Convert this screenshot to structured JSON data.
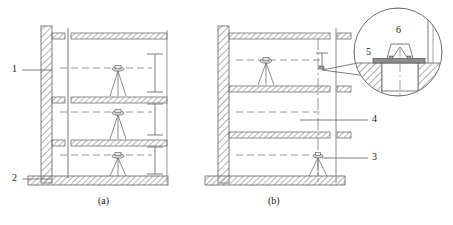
{
  "figure": {
    "captions": [
      {
        "id": "caption-a",
        "text": "(a)"
      },
      {
        "id": "caption-b",
        "text": "(b)"
      }
    ],
    "callouts": [
      {
        "id": "callout-1",
        "text": "1",
        "refers_to": "wall"
      },
      {
        "id": "callout-2",
        "text": "2",
        "refers_to": "foundation-slab"
      },
      {
        "id": "callout-3",
        "text": "3",
        "refers_to": "instrument-tripod"
      },
      {
        "id": "callout-4",
        "text": "4",
        "refers_to": "plumb-line"
      },
      {
        "id": "callout-5",
        "text": "5",
        "refers_to": "base-plate"
      },
      {
        "id": "callout-6",
        "text": "6",
        "refers_to": "target-bracket"
      }
    ],
    "colors": {
      "line": "#6b6b6b",
      "line_dark": "#4a4a4a",
      "hatch": "#8c8c8c",
      "text": "#1a1a1a",
      "background": "#ffffff"
    }
  }
}
